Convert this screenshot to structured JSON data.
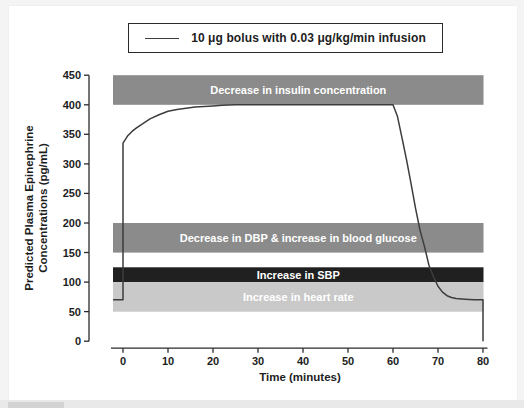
{
  "page": {
    "background_color": "#f4f4f4",
    "panel_color": "#ffffff"
  },
  "chart_data": {
    "type": "line",
    "title": "",
    "xlabel": "Time (minutes)",
    "ylabel_line1": "Predicted Plasma Epinephrine",
    "ylabel_line2": "Concentrations (pg/mL)",
    "xlim": [
      -2.2,
      80
    ],
    "ylim": [
      0,
      450
    ],
    "x_ticks": [
      0,
      10,
      20,
      30,
      40,
      50,
      60,
      70,
      80
    ],
    "y_ticks": [
      0,
      50,
      100,
      150,
      200,
      250,
      300,
      350,
      400,
      450
    ],
    "grid": false,
    "legend_position": "top-center",
    "legend": [
      {
        "name": "10 μg bolus with 0.03 μg/kg/min infusion",
        "color": "#3d3d3d"
      }
    ],
    "bands": [
      {
        "label": "Decrease in insulin concentration",
        "y_from": 400,
        "y_to": 450,
        "color": "#8b8b8b",
        "label_color": "#ffffff"
      },
      {
        "label": "Decrease in DBP & increase in blood glucose",
        "y_from": 150,
        "y_to": 200,
        "color": "#8b8b8b",
        "label_color": "#ffffff"
      },
      {
        "label": "Increase in SBP",
        "y_from": 100,
        "y_to": 125,
        "color": "#202020",
        "label_color": "#ffffff"
      },
      {
        "label": "Increase in heart rate",
        "y_from": 50,
        "y_to": 100,
        "color": "#c9c9c9",
        "label_color": "#ffffff"
      }
    ],
    "series": [
      {
        "name": "10 μg bolus with 0.03 μg/kg/min infusion",
        "color": "#3d3d3d",
        "points": [
          [
            -2.2,
            70
          ],
          [
            0,
            70
          ],
          [
            0,
            335
          ],
          [
            1,
            347
          ],
          [
            2,
            355
          ],
          [
            3,
            361
          ],
          [
            4,
            366
          ],
          [
            5,
            371
          ],
          [
            6,
            376
          ],
          [
            8,
            383
          ],
          [
            10,
            389
          ],
          [
            12,
            392
          ],
          [
            14,
            394
          ],
          [
            16,
            396
          ],
          [
            18,
            397
          ],
          [
            20,
            398
          ],
          [
            22,
            399
          ],
          [
            25,
            400
          ],
          [
            60,
            400
          ],
          [
            61,
            380
          ],
          [
            62,
            344
          ],
          [
            63,
            307
          ],
          [
            64,
            267
          ],
          [
            65,
            225
          ],
          [
            66,
            188
          ],
          [
            67,
            160
          ],
          [
            68,
            128
          ],
          [
            69,
            109
          ],
          [
            70,
            93
          ],
          [
            71,
            83
          ],
          [
            72,
            77
          ],
          [
            73,
            74
          ],
          [
            74,
            72
          ],
          [
            76,
            71
          ],
          [
            78,
            70
          ],
          [
            80,
            70
          ],
          [
            80,
            0
          ]
        ]
      }
    ]
  }
}
